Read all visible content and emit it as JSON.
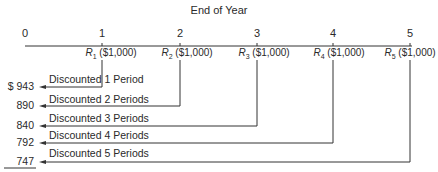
{
  "diagram": {
    "title": "End of Year",
    "ticks": [
      "0",
      "1",
      "2",
      "3",
      "4",
      "5"
    ],
    "receipts": [
      {
        "symbol": "R",
        "sub": "1",
        "amount": "($1,000)"
      },
      {
        "symbol": "R",
        "sub": "2",
        "amount": "($1,000)"
      },
      {
        "symbol": "R",
        "sub": "3",
        "amount": "($1,000)"
      },
      {
        "symbol": "R",
        "sub": "4",
        "amount": "($1,000)"
      },
      {
        "symbol": "R",
        "sub": "5",
        "amount": "($1,000)"
      }
    ],
    "discounts": [
      {
        "label": "Discounted 1 Period",
        "value": "$  943"
      },
      {
        "label": "Discounted 2 Periods",
        "value": "890"
      },
      {
        "label": "Discounted 3 Periods",
        "value": "840"
      },
      {
        "label": "Discounted 4 Periods",
        "value": "792"
      },
      {
        "label": "Discounted 5 Periods",
        "value": "747"
      }
    ],
    "line_color": "#333333"
  }
}
